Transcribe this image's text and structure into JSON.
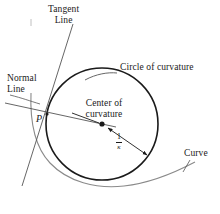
{
  "figure": {
    "background_color": "#ffffff",
    "stroke_color": "#1a1a1a",
    "curve_color": "#8a8a8a",
    "text_color": "#1a1a1a"
  },
  "labels": {
    "tangent_line": "Tangent\nLine",
    "tangent_line_1": "Tangent",
    "tangent_line_2": "Line",
    "normal_line_1": "Normal",
    "normal_line_2": "Line",
    "circle_of_curvature": "Circle of curvature",
    "center_of_curvature_1": "Center of",
    "center_of_curvature_2": "curvature",
    "curve": "Curve",
    "point_p": "P",
    "radius_numerator": "1",
    "radius_denominator": "κ"
  },
  "geometry": {
    "circle": {
      "cx": 102,
      "cy": 124,
      "r": 56
    },
    "center_point": {
      "x": 102,
      "y": 124
    },
    "point_p": {
      "x": 47,
      "y": 114
    },
    "tangent_line": {
      "x1": 73,
      "y1": 24,
      "x2": 22,
      "y2": 186
    },
    "normal_line": {
      "x1": 5,
      "y1": 103,
      "x2": 116,
      "y2": 127
    },
    "radius_arrow": {
      "x1": 108,
      "y1": 128,
      "x2": 148,
      "y2": 156
    }
  }
}
